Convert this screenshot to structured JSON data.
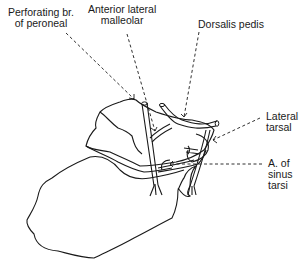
{
  "diagram": {
    "labels": {
      "perforating": {
        "line1": "Perforating br.",
        "line2": "of peroneal"
      },
      "anterior_lateral_malleolar": {
        "line1": "Anterior lateral",
        "line2": "malleolar"
      },
      "dorsalis_pedis": {
        "line1": "Dorsalis pedis"
      },
      "lateral_tarsal": {
        "line1": "Lateral",
        "line2": "tarsal"
      },
      "sinus_tarsi": {
        "line1": "A. of",
        "line2": "sinus",
        "line3": "tarsi"
      }
    },
    "colors": {
      "line": "#1a1a1a",
      "background": "#ffffff"
    }
  }
}
